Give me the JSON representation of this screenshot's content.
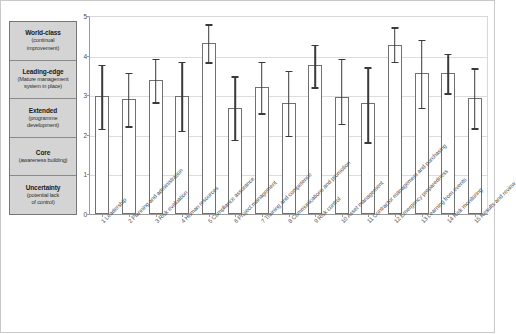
{
  "maturity_legend": {
    "levels": [
      {
        "title": "World-class",
        "sub1": "(continual",
        "sub2": "improvement)"
      },
      {
        "title": "Leading-edge",
        "sub1": "(Mature management",
        "sub2": "system in place)"
      },
      {
        "title": "Extended",
        "sub1": "(programme",
        "sub2": "development)"
      },
      {
        "title": "Core",
        "sub1": "(awareness building)",
        "sub2": ""
      },
      {
        "title": "Uncertainty",
        "sub1": "(potential lack",
        "sub2": "of control)"
      }
    ]
  },
  "chart_data": {
    "type": "bar",
    "title": "",
    "xlabel": "",
    "ylabel": "",
    "ylim": [
      0,
      5
    ],
    "yticks": [
      0,
      1,
      2,
      3,
      4,
      5
    ],
    "grid": true,
    "legend": "none",
    "error_bars": "asymmetric ranges shown as vertical lines with caps",
    "categories": [
      "1 Leadership",
      "2 Planning and administration",
      "3 Risk evaluation",
      "4 Human resources",
      "5 Compliance assurance",
      "6 Project management",
      "7 Training and competence",
      "8 Communications and promotion",
      "9 Risk control",
      "10 Asset management",
      "11 Contractor management and purchasing",
      "12 Emergency preparedness",
      "13 Learning from events",
      "14 Risk monitoring",
      "15 Results and review"
    ],
    "values": [
      2.97,
      2.9,
      3.38,
      2.97,
      4.33,
      2.67,
      3.2,
      2.8,
      3.77,
      2.95,
      2.8,
      4.28,
      3.55,
      3.55,
      2.93
    ],
    "err_low": [
      2.15,
      2.22,
      2.82,
      2.1,
      3.83,
      1.88,
      2.55,
      1.98,
      3.2,
      2.28,
      1.82,
      3.85,
      2.68,
      3.05,
      2.17
    ],
    "err_high": [
      3.77,
      3.57,
      3.92,
      3.85,
      4.8,
      3.48,
      3.85,
      3.62,
      4.28,
      3.92,
      3.7,
      4.72,
      4.4,
      4.05,
      3.68
    ]
  },
  "colors": {
    "bar_fill": "#ffffff",
    "bar_edge": "#707070",
    "error_bar": "#3a3a3a",
    "grid": "#dcdcdc",
    "legend_bg": "#d4d4d4",
    "legend_border": "#777777"
  }
}
